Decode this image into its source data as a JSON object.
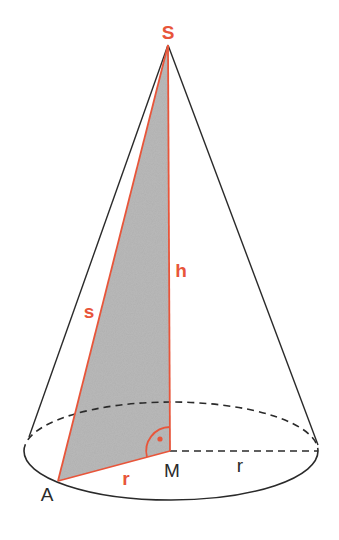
{
  "diagram": {
    "type": "cone-geometry",
    "colors": {
      "accent": "#e8553a",
      "line": "#2a2a2a",
      "shade": "#b9b9b9",
      "background": "#ffffff"
    },
    "labels": {
      "apex": "S",
      "height": "h",
      "slant": "s",
      "radius_shaded": "r",
      "center": "M",
      "radius_base": "r",
      "base_point": "A"
    }
  }
}
